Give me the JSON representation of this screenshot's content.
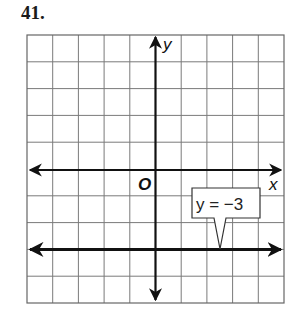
{
  "problem": {
    "number": "41."
  },
  "chart_data": {
    "type": "line",
    "title": "",
    "xlabel": "x",
    "ylabel": "y",
    "origin_label": "O",
    "xlim": [
      -5,
      5
    ],
    "ylim": [
      -5,
      5
    ],
    "grid": true,
    "grid_step": 1,
    "tick_labels": false,
    "series": [
      {
        "name": "y = -3",
        "equation": "y = -3",
        "type": "horizontal-line",
        "y": -3,
        "x": [
          -5,
          5
        ],
        "values": [
          -3,
          -3
        ],
        "arrows": "both"
      }
    ],
    "annotations": [
      {
        "text": "y = −3",
        "type": "callout",
        "points_to": {
          "x": 2.5,
          "y": -3
        }
      }
    ],
    "colors": {
      "grid": "#7a7a7a",
      "axes": "#111111",
      "line": "#111111",
      "border": "#666666"
    }
  },
  "callout": {
    "label": "y = −3"
  }
}
